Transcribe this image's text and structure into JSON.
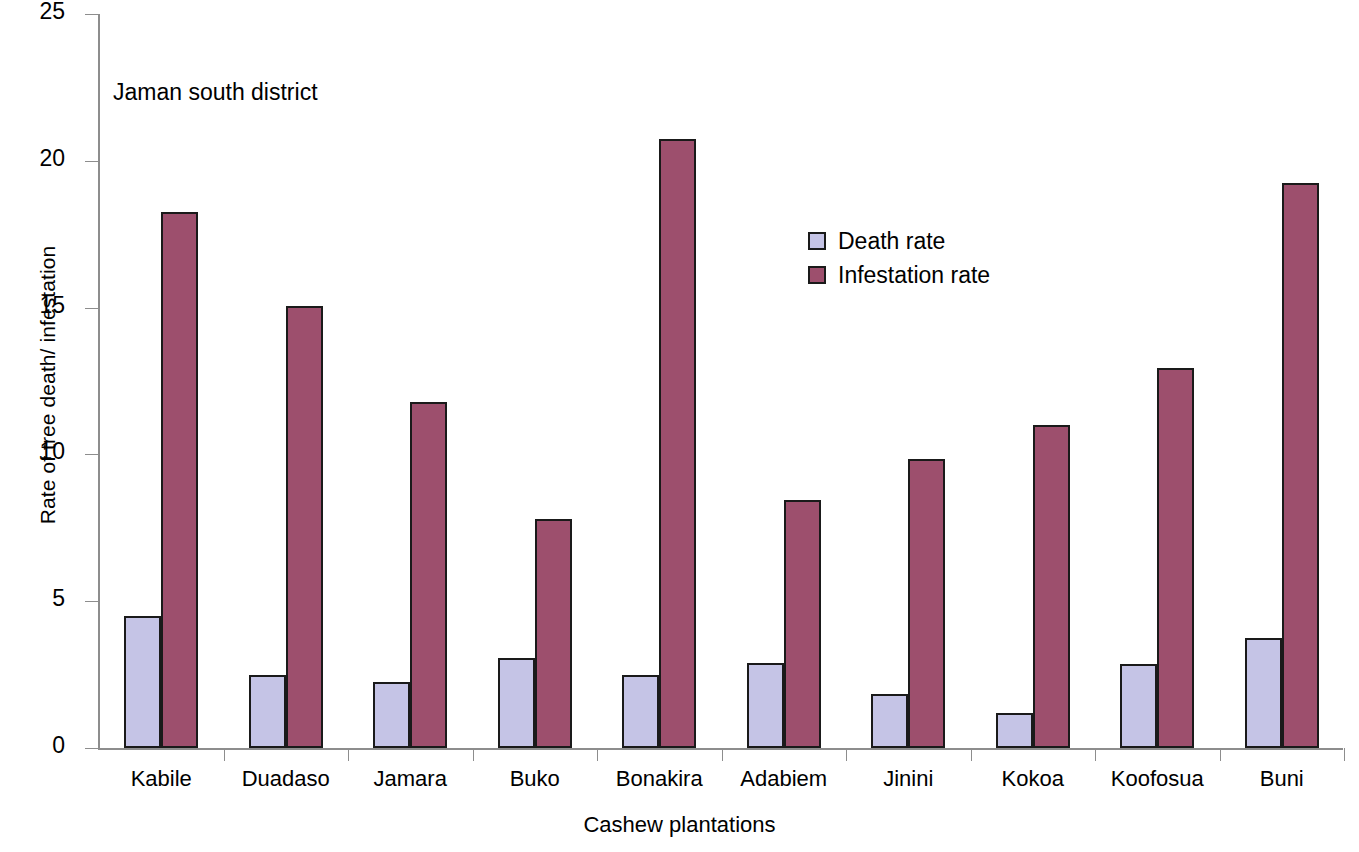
{
  "chart_data": {
    "type": "bar",
    "title": "",
    "annotation": "Jaman south district",
    "xlabel": "Cashew plantations",
    "ylabel": "Rate of tree death/ infestation",
    "ylim": [
      0,
      25
    ],
    "yticks": [
      0,
      5,
      10,
      15,
      20,
      25
    ],
    "ytick_labels": [
      "0",
      "5",
      "10",
      "15",
      "20",
      "25"
    ],
    "grid": false,
    "legend_position": "inside-top-right",
    "categories": [
      "Kabile",
      "Duadaso",
      "Jamara",
      "Buko",
      "Bonakira",
      "Adabiem",
      "Jinini",
      "Kokoa",
      "Koofosua",
      "Buni"
    ],
    "series": [
      {
        "name": "Death rate",
        "color": "#c5c4e6",
        "values": [
          4.5,
          2.5,
          2.25,
          3.05,
          2.5,
          2.9,
          1.85,
          1.2,
          2.85,
          3.75
        ]
      },
      {
        "name": "Infestation rate",
        "color": "#9d4f6d",
        "values": [
          18.25,
          15.05,
          11.8,
          7.8,
          20.75,
          8.45,
          9.85,
          11.0,
          12.95,
          19.25
        ]
      }
    ]
  }
}
